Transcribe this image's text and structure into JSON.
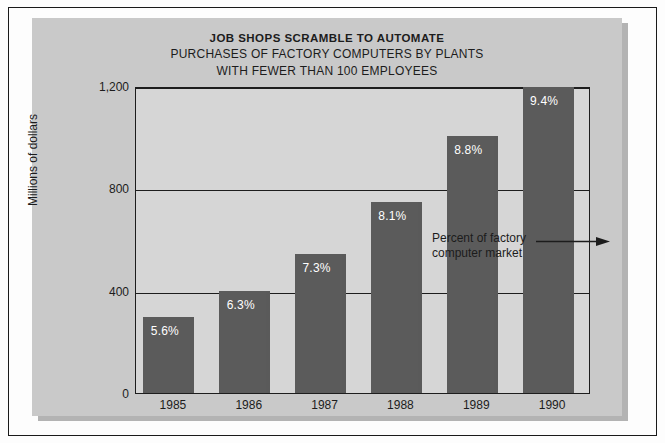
{
  "figure": {
    "title": "JOB SHOPS SCRAMBLE TO AUTOMATE",
    "subtitle_line1": "PURCHASES OF FACTORY COMPUTERS BY PLANTS",
    "subtitle_line2": "WITH FEWER THAN 100 EMPLOYEES",
    "annotation_line1": "Percent of factory",
    "annotation_line2": "computer market",
    "arrow_icon": "arrow-right-icon",
    "colors": {
      "panel_background": "#c9c9c9",
      "plot_background": "#d6d6d6",
      "bar_fill": "#5b5b5b",
      "axis_line": "#1d1d1d",
      "text": "#1c1c1c",
      "bar_label_text": "#ffffff",
      "page_background": "#fdfdfd"
    }
  },
  "chart_data": {
    "type": "bar",
    "title": "JOB SHOPS SCRAMBLE TO AUTOMATE",
    "subtitle": "PURCHASES OF FACTORY COMPUTERS BY PLANTS WITH FEWER THAN 100 EMPLOYEES",
    "xlabel": "",
    "ylabel": "Millions of dollars",
    "ylim": [
      0,
      1200
    ],
    "yticks": [
      0,
      400,
      800,
      1200
    ],
    "ytick_labels": [
      "0",
      "400",
      "800",
      "1,200"
    ],
    "grid": true,
    "legend": "none",
    "categories": [
      "1985",
      "1986",
      "1987",
      "1988",
      "1989",
      "1990"
    ],
    "values": [
      298,
      397,
      544,
      747,
      1005,
      1196
    ],
    "data_labels": [
      "5.6%",
      "6.3%",
      "7.3%",
      "8.1%",
      "8.8%",
      "9.4%"
    ],
    "annotation": {
      "text": "Percent of factory computer market",
      "points_to": "1989",
      "meaning": "the percentage labels above each bar give the share of the factory computer market"
    }
  }
}
